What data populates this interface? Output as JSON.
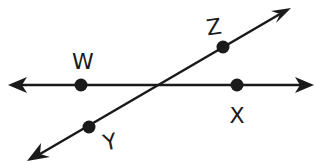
{
  "diagram": {
    "colors": {
      "stroke": "#1a1a1a",
      "background": "#ffffff"
    },
    "lines": [
      {
        "id": "line-wx",
        "name": "horizontal-line",
        "from": [
          10,
          85
        ],
        "to": [
          312,
          85
        ],
        "arrows": "both",
        "points_on_line": [
          "W",
          "X"
        ]
      },
      {
        "id": "line-yz",
        "name": "diagonal-line",
        "from": [
          30,
          160
        ],
        "to": [
          290,
          8
        ],
        "arrows": "both",
        "points_on_line": [
          "Y",
          "Z"
        ]
      }
    ],
    "points": [
      {
        "label": "W",
        "x": 81,
        "y": 85,
        "label_x": 83,
        "label_y": 61,
        "label_rotate": 0
      },
      {
        "label": "X",
        "x": 237,
        "y": 85,
        "label_x": 237,
        "label_y": 115,
        "label_rotate": 0
      },
      {
        "label": "Z",
        "x": 223,
        "y": 47,
        "label_x": 214,
        "label_y": 27,
        "label_rotate": -8
      },
      {
        "label": "Y",
        "x": 89,
        "y": 127,
        "label_x": 110,
        "label_y": 142,
        "label_rotate": -12
      }
    ]
  }
}
